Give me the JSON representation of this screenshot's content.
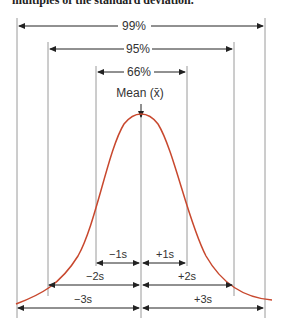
{
  "caption": "multiples of the standard deviation.",
  "diagram": {
    "mean_label": "Mean (x̄)",
    "colors": {
      "curve": "#c8482e",
      "lines": "#999999",
      "arrows": "#222222",
      "text": "#333333"
    },
    "coverage": [
      {
        "label": "99%",
        "range": "±3s"
      },
      {
        "label": "95%",
        "range": "±2s"
      },
      {
        "label": "66%",
        "range": "±1s"
      }
    ],
    "deviations": {
      "minus1": "−1s",
      "plus1": "+1s",
      "minus2": "−2s",
      "plus2": "+2s",
      "minus3": "−3s",
      "plus3": "+3s"
    }
  }
}
